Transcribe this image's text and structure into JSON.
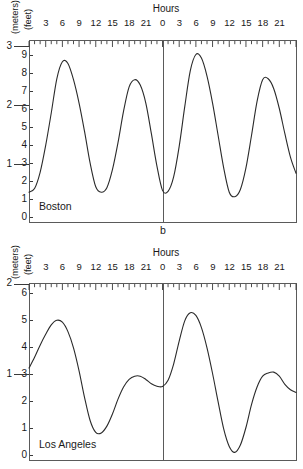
{
  "figure": {
    "panel_letter": "b",
    "axis_unit_outer": "(meters)",
    "axis_unit_inner": "(feet)",
    "hours_title": "Hours",
    "hour_ticks": [
      "3",
      "6",
      "9",
      "12",
      "15",
      "18",
      "21",
      "0",
      "3",
      "6",
      "9",
      "12",
      "15",
      "18",
      "21"
    ]
  },
  "charts": [
    {
      "id": "boston",
      "city_label": "Boston",
      "feet_ticks": [
        "0",
        "1",
        "2",
        "3",
        "4",
        "5",
        "6",
        "7",
        "8",
        "9"
      ],
      "meter_ticks": [
        "1",
        "2",
        "3"
      ]
    },
    {
      "id": "los-angeles",
      "city_label": "Los Angeles",
      "feet_ticks": [
        "0",
        "1",
        "2",
        "3",
        "4",
        "5",
        "6"
      ],
      "meter_ticks": [
        "1",
        "2"
      ]
    }
  ],
  "chart_data": [
    {
      "type": "line",
      "id": "boston",
      "title": "Boston",
      "xlabel": "Hours",
      "ylabel": "(feet)",
      "ylabel_secondary": "(meters)",
      "xlim": [
        0,
        48
      ],
      "ylim": [
        0,
        9.6
      ],
      "ylim_meters": [
        0,
        2.93
      ],
      "feet_per_meter": 3.2808,
      "grid": false,
      "legend": "none",
      "annotations": [
        "Boston",
        "b"
      ],
      "xticks": [
        3,
        6,
        9,
        12,
        15,
        18,
        21,
        24,
        27,
        30,
        33,
        36,
        39,
        42,
        45
      ],
      "xticklabels": [
        "3",
        "6",
        "9",
        "12",
        "15",
        "18",
        "21",
        "0",
        "3",
        "6",
        "9",
        "12",
        "15",
        "18",
        "21"
      ],
      "yticks_feet": [
        0,
        1,
        2,
        3,
        4,
        5,
        6,
        7,
        8,
        9
      ],
      "yticks_meters": [
        1,
        2,
        3
      ],
      "midnight_divider_x": 24,
      "tide_type": "semidiurnal",
      "extrema": [
        {
          "hour": 0.0,
          "feet": 1.35,
          "kind": "low"
        },
        {
          "hour": 5.7,
          "feet": 8.65,
          "kind": "high"
        },
        {
          "hour": 12.2,
          "feet": 1.35,
          "kind": "low"
        },
        {
          "hour": 18.3,
          "feet": 7.6,
          "kind": "high"
        },
        {
          "hour": 24.2,
          "feet": 1.35,
          "kind": "low"
        },
        {
          "hour": 30.3,
          "feet": 9.0,
          "kind": "high"
        },
        {
          "hour": 36.6,
          "feet": 1.1,
          "kind": "low"
        },
        {
          "hour": 42.6,
          "feet": 7.7,
          "kind": "high"
        },
        {
          "hour": 48.0,
          "feet": 2.4,
          "kind": "end"
        }
      ],
      "x": [
        0,
        1,
        2,
        3,
        4,
        5,
        6,
        7,
        8,
        9,
        10,
        11,
        12,
        13,
        14,
        15,
        16,
        17,
        18,
        19,
        20,
        21,
        22,
        23,
        24,
        25,
        26,
        27,
        28,
        29,
        30,
        31,
        32,
        33,
        34,
        35,
        36,
        37,
        38,
        39,
        40,
        41,
        42,
        43,
        44,
        45,
        46,
        47,
        48
      ],
      "y": [
        1.35,
        1.55,
        2.45,
        3.95,
        5.75,
        7.65,
        8.6,
        8.5,
        7.6,
        6.3,
        4.7,
        2.95,
        1.65,
        1.35,
        1.6,
        2.6,
        4.1,
        5.85,
        7.2,
        7.6,
        7.3,
        6.3,
        4.6,
        2.8,
        1.45,
        1.4,
        2.2,
        3.9,
        6.1,
        8.1,
        9.0,
        8.8,
        7.8,
        6.3,
        4.5,
        2.7,
        1.35,
        1.1,
        1.5,
        2.7,
        4.5,
        6.4,
        7.6,
        7.65,
        7.1,
        6.0,
        4.6,
        3.3,
        2.4
      ]
    },
    {
      "type": "line",
      "id": "los-angeles",
      "title": "Los Angeles",
      "xlabel": "Hours",
      "ylabel": "(feet)",
      "ylabel_secondary": "(meters)",
      "xlim": [
        0,
        48
      ],
      "ylim": [
        0,
        6.55
      ],
      "ylim_meters": [
        0,
        2.0
      ],
      "feet_per_meter": 3.2808,
      "grid": false,
      "legend": "none",
      "annotations": [
        "Los Angeles"
      ],
      "xticks": [
        3,
        6,
        9,
        12,
        15,
        18,
        21,
        24,
        27,
        30,
        33,
        36,
        39,
        42,
        45
      ],
      "xticklabels": [
        "3",
        "6",
        "9",
        "12",
        "15",
        "18",
        "21",
        "0",
        "3",
        "6",
        "9",
        "12",
        "15",
        "18",
        "21"
      ],
      "yticks_feet": [
        0,
        1,
        2,
        3,
        4,
        5,
        6
      ],
      "yticks_meters": [
        1,
        2
      ],
      "midnight_divider_x": 24,
      "tide_type": "mixed semidiurnal",
      "extrema": [
        {
          "hour": 0.0,
          "feet": 3.2,
          "kind": "start"
        },
        {
          "hour": 5.1,
          "feet": 4.97,
          "kind": "higher-high"
        },
        {
          "hour": 12.1,
          "feet": 0.78,
          "kind": "lower-low"
        },
        {
          "hour": 19.6,
          "feet": 2.92,
          "kind": "lower-high"
        },
        {
          "hour": 23.3,
          "feet": 2.52,
          "kind": "higher-low"
        },
        {
          "hour": 29.3,
          "feet": 5.25,
          "kind": "higher-high"
        },
        {
          "hour": 37.0,
          "feet": 0.08,
          "kind": "lower-low"
        },
        {
          "hour": 44.0,
          "feet": 3.05,
          "kind": "lower-high"
        },
        {
          "hour": 48.0,
          "feet": 2.3,
          "kind": "end"
        }
      ],
      "x": [
        0,
        1,
        2,
        3,
        4,
        5,
        6,
        7,
        8,
        9,
        10,
        11,
        12,
        13,
        14,
        15,
        16,
        17,
        18,
        19,
        20,
        21,
        22,
        23,
        24,
        25,
        26,
        27,
        28,
        29,
        30,
        31,
        32,
        33,
        34,
        35,
        36,
        37,
        38,
        39,
        40,
        41,
        42,
        43,
        44,
        45,
        46,
        47,
        48
      ],
      "y": [
        3.2,
        3.6,
        4.05,
        4.45,
        4.8,
        4.97,
        4.9,
        4.55,
        3.95,
        3.1,
        2.1,
        1.25,
        0.82,
        0.8,
        1.05,
        1.5,
        2.05,
        2.5,
        2.78,
        2.9,
        2.9,
        2.78,
        2.62,
        2.53,
        2.52,
        2.75,
        3.35,
        4.2,
        4.95,
        5.25,
        5.15,
        4.7,
        3.95,
        3.0,
        1.95,
        0.95,
        0.3,
        0.08,
        0.35,
        1.0,
        1.85,
        2.5,
        2.9,
        3.02,
        3.05,
        2.9,
        2.6,
        2.4,
        2.3
      ]
    }
  ]
}
